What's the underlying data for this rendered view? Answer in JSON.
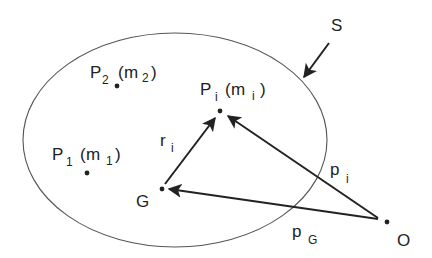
{
  "diagram": {
    "set_label": "S",
    "points": [
      {
        "id": "P2",
        "name": "P",
        "sub": "2",
        "mass": "m",
        "mass_sub": "2"
      },
      {
        "id": "Pi",
        "name": "P",
        "sub": "i",
        "mass": "m",
        "mass_sub": "i"
      },
      {
        "id": "P1",
        "name": "P",
        "sub": "1",
        "mass": "m",
        "mass_sub": "1"
      }
    ],
    "centroid_label": "G",
    "origin_label": "O",
    "vectors": [
      {
        "id": "ri",
        "name": "r",
        "sub": "i",
        "from": "G",
        "to": "Pi"
      },
      {
        "id": "pi",
        "name": "p",
        "sub": "i",
        "from": "O",
        "to": "Pi"
      },
      {
        "id": "pG",
        "name": "p",
        "sub": "G",
        "from": "O",
        "to": "G"
      }
    ],
    "colors": {
      "ink": "#222222",
      "ellipse": "#555555",
      "background": "#ffffff"
    }
  }
}
